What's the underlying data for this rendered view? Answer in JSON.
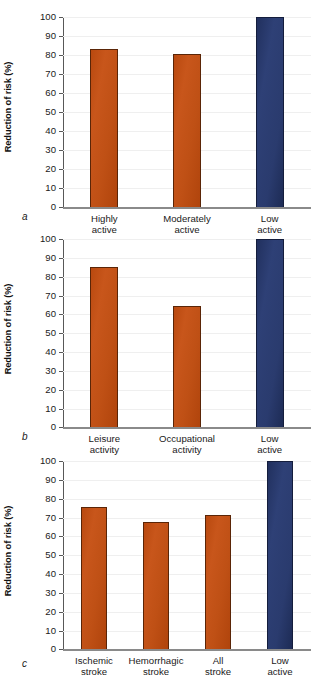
{
  "figure": {
    "width": 322,
    "height": 673,
    "colors": {
      "orange": "#bf5015",
      "orange_edge": "#5a2507",
      "blue": "#2a3b6e",
      "blue_edge": "#141d3c",
      "axis": "#585858",
      "grid": "#efefef",
      "text": "#1a1a1a"
    }
  },
  "chart_data": [
    {
      "type": "bar",
      "panel": "a",
      "panel_label": "a",
      "title": "",
      "xlabel": "",
      "ylabel": "Reduction of risk (%)",
      "ylim": [
        0,
        100
      ],
      "yticks": [
        0,
        10,
        20,
        30,
        40,
        50,
        60,
        70,
        80,
        90,
        100
      ],
      "ytick_labels": [
        "0",
        "10",
        "20",
        "30",
        "40",
        "50",
        "60",
        "70",
        "80",
        "90",
        "100"
      ],
      "grid": true,
      "legend": "none",
      "categories": [
        "Highly active",
        "Moderately active",
        "Low active"
      ],
      "category_lines": [
        [
          "Highly",
          "active"
        ],
        [
          "Moderately",
          "active"
        ],
        [
          "Low",
          "active"
        ]
      ],
      "values": [
        83,
        80.5,
        100
      ],
      "bar_colors": [
        "#bf5015",
        "#bf5015",
        "#2a3b6e"
      ]
    },
    {
      "type": "bar",
      "panel": "b",
      "panel_label": "b",
      "title": "",
      "xlabel": "",
      "ylabel": "Reduction of risk (%)",
      "ylim": [
        0,
        100
      ],
      "yticks": [
        0,
        10,
        20,
        30,
        40,
        50,
        60,
        70,
        80,
        90,
        100
      ],
      "ytick_labels": [
        "0",
        "10",
        "20",
        "30",
        "40",
        "50",
        "60",
        "70",
        "80",
        "90",
        "100"
      ],
      "grid": true,
      "legend": "none",
      "categories": [
        "Leisure activity",
        "Occupational activity",
        "Low active"
      ],
      "category_lines": [
        [
          "Leisure",
          "activity"
        ],
        [
          "Occupational",
          "activity"
        ],
        [
          "Low",
          "active"
        ]
      ],
      "values": [
        85,
        64.5,
        100
      ],
      "bar_colors": [
        "#bf5015",
        "#bf5015",
        "#2a3b6e"
      ]
    },
    {
      "type": "bar",
      "panel": "c",
      "panel_label": "c",
      "title": "",
      "xlabel": "",
      "ylabel": "Reduction of risk (%)",
      "ylim": [
        0,
        100
      ],
      "yticks": [
        0,
        10,
        20,
        30,
        40,
        50,
        60,
        70,
        80,
        90,
        100
      ],
      "ytick_labels": [
        "0",
        "10",
        "20",
        "30",
        "40",
        "50",
        "60",
        "70",
        "80",
        "90",
        "100"
      ],
      "grid": true,
      "legend": "none",
      "categories": [
        "Ischemic stroke",
        "Hemorrhagic stroke",
        "All stroke",
        "Low active"
      ],
      "category_lines": [
        [
          "Ischemic",
          "stroke"
        ],
        [
          "Hemorrhagic",
          "stroke"
        ],
        [
          "All",
          "stroke"
        ],
        [
          "Low",
          "active"
        ]
      ],
      "values": [
        75.5,
        67.5,
        71.5,
        100
      ],
      "bar_colors": [
        "#bf5015",
        "#bf5015",
        "#bf5015",
        "#2a3b6e"
      ]
    }
  ]
}
